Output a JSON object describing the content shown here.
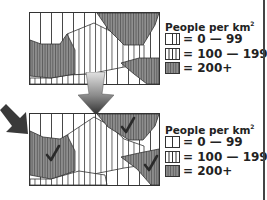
{
  "maps": [
    {
      "id": "before",
      "checkmarks": false,
      "legend": {
        "title": "People per km",
        "title_superscript": "2",
        "items": [
          {
            "pattern": "sparse-stripes",
            "label": "= 0 — 99"
          },
          {
            "pattern": "medium-stripes",
            "label": "= 100 — 199"
          },
          {
            "pattern": "dense-stripes-shaded",
            "label": "= 200+"
          }
        ]
      }
    },
    {
      "id": "after",
      "checkmarks": true,
      "checkmark_count": 3,
      "legend": {
        "title": "People per km",
        "title_superscript": "2",
        "items": [
          {
            "pattern": "sparse-stripes",
            "label": "= 0 — 99"
          },
          {
            "pattern": "medium-stripes",
            "label": "= 100 — 199"
          },
          {
            "pattern": "dense-stripes-shaded",
            "label": "= 200+"
          }
        ]
      }
    }
  ],
  "arrows": [
    {
      "name": "down-arrow",
      "direction": "down",
      "style": "grey-gradient"
    },
    {
      "name": "diagonal-arrow",
      "direction": "down-right",
      "style": "dark-grey"
    }
  ],
  "colors": {
    "line": "#333333",
    "shade_high": "#8c8c8c",
    "background": "#ffffff",
    "arrow_dark": "#3a3a3a",
    "arrow_light": "#d8d8d8"
  }
}
